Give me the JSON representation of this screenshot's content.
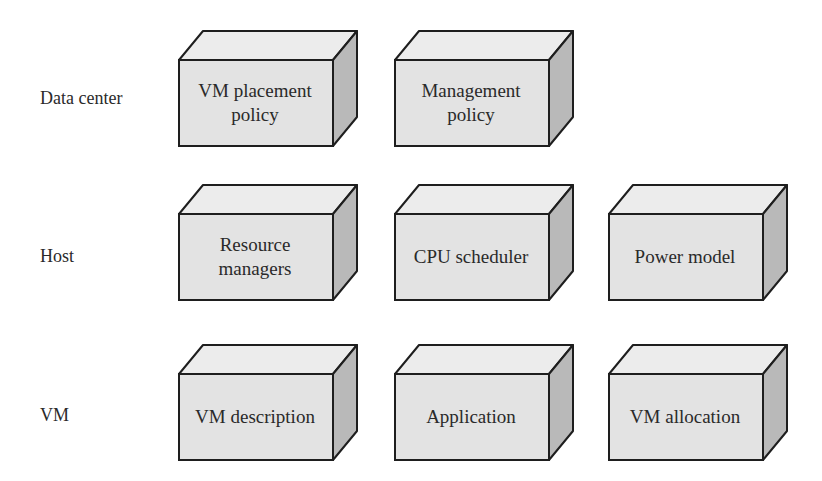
{
  "diagram": {
    "colors": {
      "front": "#e3e3e3",
      "top": "#ececec",
      "side": "#b9b9b9",
      "stroke": "#1e1e1e"
    },
    "rows": [
      {
        "label": "Data center",
        "boxes": [
          {
            "text": "VM placement\npolicy"
          },
          {
            "text": "Management\npolicy"
          }
        ]
      },
      {
        "label": "Host",
        "boxes": [
          {
            "text": "Resource\nmanagers"
          },
          {
            "text": "CPU scheduler"
          },
          {
            "text": "Power model"
          }
        ]
      },
      {
        "label": "VM",
        "boxes": [
          {
            "text": "VM description"
          },
          {
            "text": "Application"
          },
          {
            "text": "VM allocation"
          }
        ]
      }
    ]
  }
}
